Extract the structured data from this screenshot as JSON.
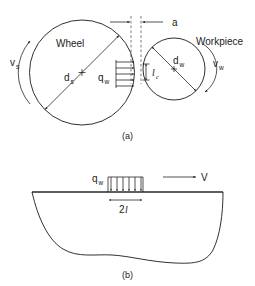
{
  "figure": {
    "panels": [
      {
        "id": "a",
        "caption": "(a)",
        "description": "Grinding wheel and workpiece in contact"
      },
      {
        "id": "b",
        "caption": "(b)",
        "description": "Moving band heat source on workpiece surface"
      }
    ]
  },
  "panel_a": {
    "wheel_label": "Wheel",
    "workpiece_label": "Workpiece",
    "wheel_diameter_label": "d",
    "wheel_diameter_sub": "s",
    "workpiece_diameter_label": "d",
    "workpiece_diameter_sub": "w",
    "wheel_speed_label": "v",
    "wheel_speed_sub": "s",
    "workpiece_speed_label": "v",
    "workpiece_speed_sub": "w",
    "heat_flux_label": "q",
    "heat_flux_sub": "w",
    "contact_length_label": "l",
    "contact_length_sub": "c",
    "depth_of_cut_label": "a",
    "caption": "(a)",
    "heat_flux_arrow_count": 5
  },
  "panel_b": {
    "heat_flux_label": "q",
    "heat_flux_sub": "w",
    "velocity_label": "V",
    "width_label_prefix": "2",
    "width_label_symbol": "l",
    "caption": "(b)",
    "heat_flux_arrow_count": 6
  },
  "colors": {
    "line": "#1a1a1a",
    "dashed": "#555555",
    "background": "#ffffff",
    "text": "#1a1a1a"
  }
}
